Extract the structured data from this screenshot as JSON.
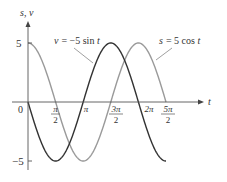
{
  "chart_data": {
    "type": "line",
    "title": "",
    "xlabel": "t",
    "ylabel": "s, v",
    "xlim": [
      0,
      7.854
    ],
    "ylim": [
      -5,
      5
    ],
    "x_ticks": [
      {
        "value": 0,
        "label": "0"
      },
      {
        "value": 1.5708,
        "label_num": "π",
        "label_den": "2"
      },
      {
        "value": 3.1416,
        "label": "π"
      },
      {
        "value": 4.7124,
        "label_num": "3π",
        "label_den": "2"
      },
      {
        "value": 6.2832,
        "label": "2π"
      },
      {
        "value": 7.854,
        "label_num": "5π",
        "label_den": "2"
      }
    ],
    "y_ticks": [
      {
        "value": 5,
        "label": "5"
      },
      {
        "value": -5,
        "label": "−5"
      }
    ],
    "grid": false,
    "legend": "inline annotations",
    "series": [
      {
        "name": "s = 5 cos t",
        "function": "5*cos(t)",
        "color": "#9a9a9a",
        "x": [
          0,
          0.7854,
          1.5708,
          2.3562,
          3.1416,
          3.927,
          4.7124,
          5.4978,
          6.2832,
          7.0686,
          7.854
        ],
        "values": [
          5,
          3.54,
          0,
          -3.54,
          -5,
          -3.54,
          0,
          3.54,
          5,
          3.54,
          0
        ]
      },
      {
        "name": "v = −5 sin t",
        "function": "-5*sin(t)",
        "color": "#333333",
        "x": [
          0,
          0.7854,
          1.5708,
          2.3562,
          3.1416,
          3.927,
          4.7124,
          5.4978,
          6.2832,
          7.0686,
          7.854
        ],
        "values": [
          0,
          -3.54,
          -5,
          -3.54,
          0,
          3.54,
          5,
          3.54,
          0,
          -3.54,
          -5
        ]
      }
    ],
    "annotations": [
      {
        "text_lhs": "v",
        "text_rhs": "= −5 sin ",
        "text_var": "t",
        "series": "v = −5 sin t"
      },
      {
        "text_lhs": "s",
        "text_rhs": "= 5 cos ",
        "text_var": "t",
        "series": "s = 5 cos t"
      }
    ]
  }
}
